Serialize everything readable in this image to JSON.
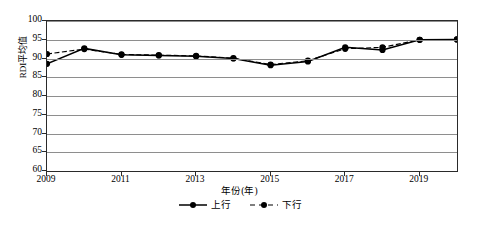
{
  "chart_data": {
    "type": "line",
    "title": "",
    "xlabel": "年份(年)",
    "ylabel": "RDI平均值",
    "x": [
      2009,
      2010,
      2011,
      2012,
      2013,
      2014,
      2015,
      2016,
      2017,
      2018,
      2019,
      2020
    ],
    "xtick_labels": [
      "2009",
      "2011",
      "2013",
      "2015",
      "2017",
      "2019"
    ],
    "xticks": [
      2009,
      2011,
      2013,
      2015,
      2017,
      2019
    ],
    "ytick_labels": [
      "60",
      "65",
      "70",
      "75",
      "80",
      "85",
      "90",
      "95",
      "100"
    ],
    "yticks": [
      60,
      65,
      70,
      75,
      80,
      85,
      90,
      95,
      100
    ],
    "ylim": [
      60,
      100
    ],
    "xlim": [
      2009,
      2020
    ],
    "grid": true,
    "legend_position": "bottom",
    "series": [
      {
        "name": "上行",
        "style": "solid",
        "marker": "circle",
        "color": "#000000",
        "values": [
          88.6,
          92.7,
          91.0,
          90.8,
          90.6,
          90.0,
          88.2,
          89.2,
          93.0,
          92.3,
          95.0,
          95.1
        ]
      },
      {
        "name": "下行",
        "style": "dashed",
        "marker": "circle",
        "color": "#000000",
        "values": [
          91.2,
          92.5,
          91.1,
          90.9,
          90.7,
          90.1,
          88.4,
          89.4,
          92.6,
          93.0,
          95.0,
          95.1
        ]
      }
    ]
  },
  "axis": {
    "y_title": "RDI平均值",
    "x_title": "年份(年)"
  },
  "legend": {
    "items": [
      {
        "label": "上行",
        "style": "solid"
      },
      {
        "label": "下行",
        "style": "dashed"
      }
    ]
  }
}
